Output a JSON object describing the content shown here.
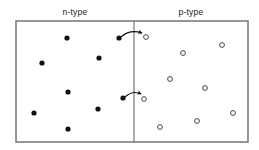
{
  "figure": {
    "title": "",
    "type": "semiconductor-pn-junction-diagram",
    "canvas": {
      "width": 259,
      "height": 150,
      "background": "#ffffff"
    },
    "box": {
      "x": 16,
      "y": 21,
      "width": 232,
      "height": 121,
      "stroke": "#6b6b6b",
      "stroke_width": 1.4,
      "fill": "#ffffff"
    },
    "divider": {
      "x": 134,
      "y1": 21,
      "y2": 142,
      "stroke": "#6b6b6b",
      "stroke_width": 1.1
    },
    "labels": {
      "left": "n-type",
      "right": "p-type"
    }
  },
  "chart_data": {
    "type": "scatter",
    "xlabel": "",
    "ylabel": "",
    "xlim": [
      16,
      248
    ],
    "ylim": [
      21,
      142
    ],
    "grid": false,
    "legend": null,
    "annotations": [
      {
        "text": "n-type",
        "x": 75,
        "y": 13
      },
      {
        "text": "p-type",
        "x": 191,
        "y": 13
      }
    ],
    "series": [
      {
        "name": "electrons",
        "marker": "filled-circle",
        "color": "#111111",
        "radius": 2.6,
        "points": [
          {
            "x": 67,
            "y": 38
          },
          {
            "x": 119,
            "y": 38
          },
          {
            "x": 42,
            "y": 63
          },
          {
            "x": 99,
            "y": 58
          },
          {
            "x": 68,
            "y": 92
          },
          {
            "x": 123,
            "y": 98
          },
          {
            "x": 34,
            "y": 113
          },
          {
            "x": 98,
            "y": 109
          },
          {
            "x": 68,
            "y": 129
          }
        ]
      },
      {
        "name": "holes",
        "marker": "open-circle",
        "color": "#444444",
        "radius": 2.4,
        "points": [
          {
            "x": 146,
            "y": 37
          },
          {
            "x": 183,
            "y": 53
          },
          {
            "x": 222,
            "y": 45
          },
          {
            "x": 170,
            "y": 79
          },
          {
            "x": 205,
            "y": 88
          },
          {
            "x": 144,
            "y": 99
          },
          {
            "x": 233,
            "y": 113
          },
          {
            "x": 197,
            "y": 121
          },
          {
            "x": 160,
            "y": 127
          }
        ]
      }
    ],
    "arrows": [
      {
        "name": "upper-recombination-arrow",
        "from_x": 121,
        "from_y": 37,
        "ctrl_x": 130,
        "ctrl_y": 29,
        "to_x": 142,
        "to_y": 33
      },
      {
        "name": "lower-recombination-arrow",
        "from_x": 125,
        "from_y": 97,
        "ctrl_x": 133,
        "ctrl_y": 90,
        "to_x": 141,
        "to_y": 94
      }
    ]
  }
}
